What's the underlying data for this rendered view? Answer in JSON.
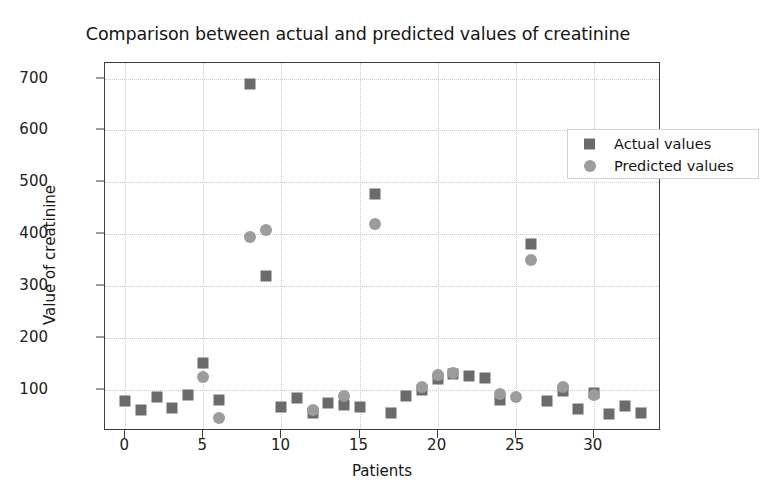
{
  "chart_data": {
    "type": "scatter",
    "title": "Comparison between actual and predicted values of creatinine",
    "xlabel": "Patients",
    "ylabel": "Value of creatinine",
    "xlim": [
      -1.3,
      34.3
    ],
    "ylim": [
      20,
      730
    ],
    "xticks": [
      0,
      5,
      10,
      15,
      20,
      25,
      30
    ],
    "yticks": [
      100,
      200,
      300,
      400,
      500,
      600,
      700
    ],
    "grid": true,
    "legend_position": "upper right",
    "colors": {
      "actual": "#6b6b6b",
      "predicted": "#9c9c9c",
      "axis": "#3c3c3c",
      "grid": "#c9c9c9",
      "background": "#ffffff"
    },
    "series": [
      {
        "name": "Actual values",
        "marker": "square",
        "color": "#6b6b6b",
        "points": [
          {
            "x": 0,
            "y": 78
          },
          {
            "x": 1,
            "y": 60
          },
          {
            "x": 2,
            "y": 85
          },
          {
            "x": 3,
            "y": 64
          },
          {
            "x": 4,
            "y": 90
          },
          {
            "x": 5,
            "y": 152
          },
          {
            "x": 6,
            "y": 80
          },
          {
            "x": 8,
            "y": 690
          },
          {
            "x": 9,
            "y": 320
          },
          {
            "x": 10,
            "y": 66
          },
          {
            "x": 11,
            "y": 84
          },
          {
            "x": 12,
            "y": 55
          },
          {
            "x": 13,
            "y": 74
          },
          {
            "x": 14,
            "y": 70
          },
          {
            "x": 15,
            "y": 67
          },
          {
            "x": 16,
            "y": 478
          },
          {
            "x": 17,
            "y": 54
          },
          {
            "x": 18,
            "y": 88
          },
          {
            "x": 19,
            "y": 100
          },
          {
            "x": 20,
            "y": 120
          },
          {
            "x": 21,
            "y": 130
          },
          {
            "x": 22,
            "y": 126
          },
          {
            "x": 23,
            "y": 122
          },
          {
            "x": 24,
            "y": 80
          },
          {
            "x": 26,
            "y": 380
          },
          {
            "x": 27,
            "y": 77
          },
          {
            "x": 28,
            "y": 98
          },
          {
            "x": 29,
            "y": 62
          },
          {
            "x": 30,
            "y": 94
          },
          {
            "x": 31,
            "y": 52
          },
          {
            "x": 32,
            "y": 68
          },
          {
            "x": 33,
            "y": 55
          }
        ]
      },
      {
        "name": "Predicted values",
        "marker": "circle",
        "color": "#9c9c9c",
        "points": [
          {
            "x": 5,
            "y": 125
          },
          {
            "x": 6,
            "y": 46
          },
          {
            "x": 8,
            "y": 395
          },
          {
            "x": 9,
            "y": 408
          },
          {
            "x": 12,
            "y": 60
          },
          {
            "x": 14,
            "y": 88
          },
          {
            "x": 16,
            "y": 420
          },
          {
            "x": 19,
            "y": 105
          },
          {
            "x": 20,
            "y": 128
          },
          {
            "x": 21,
            "y": 132
          },
          {
            "x": 24,
            "y": 92
          },
          {
            "x": 25,
            "y": 85
          },
          {
            "x": 26,
            "y": 350
          },
          {
            "x": 28,
            "y": 104
          },
          {
            "x": 30,
            "y": 90
          }
        ]
      }
    ]
  },
  "legend": {
    "items": [
      {
        "label": "Actual values",
        "marker": "square"
      },
      {
        "label": "Predicted values",
        "marker": "circle"
      }
    ]
  }
}
